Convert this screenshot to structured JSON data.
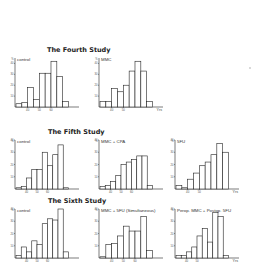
{
  "figure": {
    "studies": [
      {
        "title": "The Fourth Study",
        "panels": [
          {
            "label": "control",
            "xticks": [
              "40",
              "50",
              "60"
            ],
            "yticks": [
              "10",
              "20",
              "30",
              "40"
            ],
            "ymax_label": "%",
            "x_unit": ""
          },
          {
            "label": "MMC",
            "xticks": [
              "40",
              "50"
            ],
            "yticks": [
              "10",
              "20",
              "30",
              "40"
            ],
            "ymax_label": "%",
            "x_unit": "Yrs"
          }
        ]
      },
      {
        "title": "The Fifth Study",
        "panels": [
          {
            "label": "control",
            "xticks": [
              "40",
              "50",
              "60"
            ],
            "yticks": [
              "10",
              "20",
              "30",
              "40"
            ],
            "ymax_label": "%",
            "x_unit": ""
          },
          {
            "label": "MMC + CPA",
            "xticks": [
              "40",
              "50",
              "60"
            ],
            "yticks": [
              "10",
              "20",
              "30",
              "40"
            ],
            "ymax_label": "%",
            "x_unit": ""
          },
          {
            "label": "5FU",
            "xticks": [
              "40",
              "50"
            ],
            "yticks": [
              "10",
              "20",
              "30",
              "40"
            ],
            "ymax_label": "%",
            "x_unit": "Yrs"
          }
        ]
      },
      {
        "title": "The Sixth Study",
        "panels": [
          {
            "label": "control",
            "xticks": [
              "40",
              "50",
              "60"
            ],
            "yticks": [
              "10",
              "20",
              "30",
              "40"
            ],
            "ymax_label": "%",
            "x_unit": ""
          },
          {
            "label": "MMC + 5FU (Simultaneous)",
            "xticks": [
              "40",
              "50",
              "60"
            ],
            "yticks": [
              "10",
              "20",
              "30",
              "40"
            ],
            "ymax_label": "%",
            "x_unit": ""
          },
          {
            "label": "Perop. MMC + Postop. 5FU",
            "xticks": [
              "40",
              "50"
            ],
            "yticks": [
              "10",
              "20",
              "30",
              "40"
            ],
            "ymax_label": "%",
            "x_unit": "Yrs"
          }
        ]
      }
    ]
  },
  "chart_data": [
    {
      "type": "bar",
      "title": "The Fourth Study — control",
      "xlabel": "Age (Yrs)",
      "ylabel": "%",
      "categories": [
        "30-34",
        "35-39",
        "40-44",
        "45-49",
        "50-54",
        "55-59",
        "60-64",
        "65-69",
        "70-74"
      ],
      "values": [
        3,
        4,
        18,
        7,
        31,
        31,
        42,
        28,
        5
      ],
      "ylim": [
        0,
        45
      ]
    },
    {
      "type": "bar",
      "title": "The Fourth Study — MMC",
      "xlabel": "Age (Yrs)",
      "ylabel": "%",
      "categories": [
        "30-34",
        "35-39",
        "40-44",
        "45-49",
        "50-54",
        "55-59",
        "60-64",
        "65-69",
        "70-74"
      ],
      "values": [
        5,
        5,
        17,
        14,
        20,
        33,
        42,
        33,
        5
      ],
      "ylim": [
        0,
        45
      ]
    },
    {
      "type": "bar",
      "title": "The Fifth Study — control",
      "xlabel": "Age (Yrs)",
      "ylabel": "%",
      "categories": [
        "30-34",
        "35-39",
        "40-44",
        "45-49",
        "50-54",
        "55-59",
        "60-64",
        "65-69",
        "70-74"
      ],
      "values": [
        1,
        2,
        9,
        16,
        16,
        30,
        19,
        28,
        36,
        1
      ],
      "ylim": [
        0,
        40
      ]
    },
    {
      "type": "bar",
      "title": "The Fifth Study — MMC + CPA",
      "xlabel": "Age (Yrs)",
      "ylabel": "%",
      "categories": [
        "30-34",
        "35-39",
        "40-44",
        "45-49",
        "50-54",
        "55-59",
        "60-64",
        "65-69",
        "70-74",
        "75-79"
      ],
      "values": [
        2,
        3,
        6,
        11,
        20,
        22,
        24,
        27,
        27,
        3
      ],
      "ylim": [
        0,
        40
      ]
    },
    {
      "type": "bar",
      "title": "The Fifth Study — 5FU",
      "xlabel": "Age (Yrs)",
      "ylabel": "%",
      "categories": [
        "30-34",
        "35-39",
        "40-44",
        "45-49",
        "50-54",
        "55-59",
        "60-64",
        "65-69",
        "70-74"
      ],
      "values": [
        3,
        1,
        8,
        13,
        19,
        22,
        28,
        37,
        30
      ],
      "ylim": [
        0,
        40
      ]
    },
    {
      "type": "bar",
      "title": "The Sixth Study — control",
      "xlabel": "Age (Yrs)",
      "ylabel": "%",
      "categories": [
        "30-34",
        "35-39",
        "40-44",
        "45-49",
        "50-54",
        "55-59",
        "60-64",
        "65-69",
        "70-74"
      ],
      "values": [
        2,
        9,
        5,
        14,
        11,
        28,
        32,
        31,
        40,
        5
      ],
      "ylim": [
        0,
        40
      ]
    },
    {
      "type": "bar",
      "title": "The Sixth Study — MMC + 5FU (Simultaneous)",
      "xlabel": "Age (Yrs)",
      "ylabel": "%",
      "categories": [
        "30-34",
        "35-39",
        "40-44",
        "45-49",
        "50-54",
        "55-59",
        "60-64",
        "65-69",
        "70-74"
      ],
      "values": [
        1,
        11,
        12,
        18,
        26,
        22,
        22,
        34,
        6
      ],
      "ylim": [
        0,
        40
      ]
    },
    {
      "type": "bar",
      "title": "The Sixth Study — Perop. MMC + Postop. 5FU",
      "xlabel": "Age (Yrs)",
      "ylabel": "%",
      "categories": [
        "30-34",
        "35-39",
        "40-44",
        "45-49",
        "50-54",
        "55-59",
        "60-64",
        "65-69",
        "70-74",
        "75-79"
      ],
      "values": [
        2,
        2,
        5,
        9,
        18,
        24,
        13,
        37,
        34,
        2
      ],
      "ylim": [
        0,
        40
      ]
    }
  ]
}
